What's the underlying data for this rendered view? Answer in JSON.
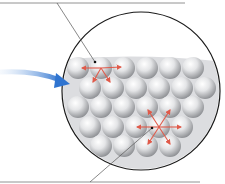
{
  "diagram": {
    "title": "",
    "colors": {
      "background": "#ffffff",
      "circle_border": "#1a1a1a",
      "liquid_fill": "#d9dadc",
      "sphere_light": "#ffffff",
      "sphere_dark": "#9a9ca0",
      "force_arrow": "#e05a4a",
      "pointer_arrow": "#3a7fd6",
      "leader_line": "#555555"
    },
    "magnifier": {
      "cx": 141,
      "cy": 91,
      "r": 79
    },
    "sphere_radius": 11,
    "rows": [
      {
        "y": 68,
        "x": [
          78,
          101,
          124,
          147,
          170,
          193
        ]
      },
      {
        "y": 88,
        "x": [
          90,
          113,
          136,
          159,
          182,
          205
        ]
      },
      {
        "y": 107,
        "x": [
          78,
          101,
          124,
          147,
          170,
          193
        ]
      },
      {
        "y": 127,
        "x": [
          90,
          113,
          136,
          159,
          182
        ]
      },
      {
        "y": 146,
        "x": [
          101,
          124,
          147,
          170
        ]
      }
    ],
    "surface_molecule": {
      "cx": 101,
      "cy": 68,
      "label_line": [
        [
          57,
          3
        ],
        [
          95,
          62
        ]
      ],
      "label_text": ""
    },
    "interior_molecule": {
      "cx": 159,
      "cy": 127,
      "label_line": [
        [
          90,
          182
        ],
        [
          152,
          128
        ]
      ],
      "label_text": ""
    },
    "top_rule": {
      "x1": 0,
      "x2": 185,
      "y": 3
    },
    "bottom_rule": {
      "x1": 0,
      "x2": 200,
      "y": 182
    }
  }
}
